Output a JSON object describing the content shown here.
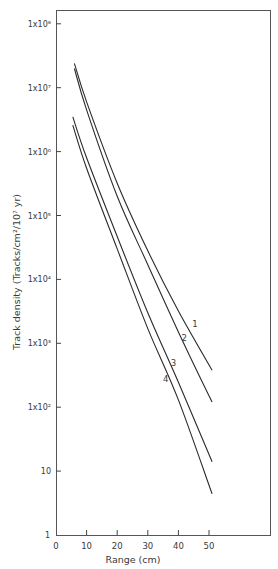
{
  "chart_data": {
    "type": "line",
    "title": "",
    "xlabel": "Range (cm)",
    "ylabel": "Track density (Tracks/cm²/10⁷ yr)",
    "yscale": "log",
    "xlim": [
      0,
      70
    ],
    "ylim": [
      1,
      100000000
    ],
    "grid": false,
    "legend": "inline curve labels",
    "x_ticks": [
      0,
      10,
      20,
      30,
      40,
      50
    ],
    "x_tick_labels": [
      "0",
      "10",
      "20",
      "30",
      "40",
      "50"
    ],
    "y_ticks": [
      1,
      10,
      100,
      1000,
      10000,
      100000,
      1000000,
      10000000,
      100000000
    ],
    "y_tick_labels": [
      "1",
      "10",
      "1x10²",
      "1x10³",
      "1x10⁴",
      "1x10⁵",
      "1x10⁶",
      "1x10⁷",
      "1x10⁸"
    ],
    "series": [
      {
        "name": "1",
        "x": [
          6,
          10,
          20,
          30,
          40,
          51
        ],
        "values": [
          24000000,
          6000000,
          320000,
          28000,
          3200,
          380
        ]
      },
      {
        "name": "2",
        "x": [
          6,
          10,
          20,
          30,
          40,
          51
        ],
        "values": [
          20000000,
          4500000,
          200000,
          17000,
          1500,
          120
        ]
      },
      {
        "name": "3",
        "x": [
          5.5,
          10,
          20,
          30,
          40,
          51
        ],
        "values": [
          3500000,
          800000,
          47000,
          3000,
          245,
          14
        ]
      },
      {
        "name": "4",
        "x": [
          5.5,
          10,
          20,
          30,
          40,
          51
        ],
        "values": [
          2600000,
          550000,
          30000,
          1700,
          130,
          4.4
        ]
      }
    ],
    "curve_label_positions": [
      {
        "name": "1",
        "x": 44.5,
        "y": 1800
      },
      {
        "name": "2",
        "x": 41,
        "y": 1100
      },
      {
        "name": "3",
        "x": 37.5,
        "y": 440
      },
      {
        "name": "4",
        "x": 35,
        "y": 250
      }
    ]
  }
}
